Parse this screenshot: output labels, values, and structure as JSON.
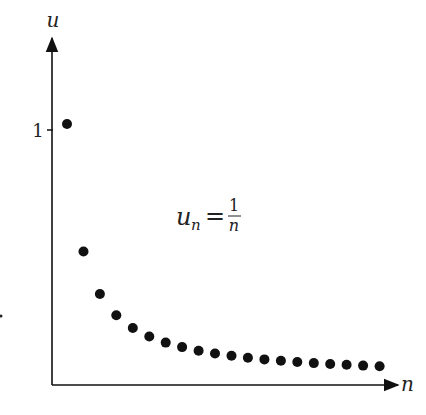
{
  "chart_data": {
    "type": "scatter",
    "title": "",
    "xlabel": "n",
    "ylabel": "u",
    "annotation": {
      "lhs": "u",
      "sub": "n",
      "eq": "=",
      "num": "1",
      "den": "n"
    },
    "y_ticks": [
      {
        "value": 1,
        "label": "1"
      }
    ],
    "x": [
      1,
      2,
      3,
      4,
      5,
      6,
      7,
      8,
      9,
      10,
      11,
      12,
      13,
      14,
      15,
      16,
      17,
      18,
      19,
      20
    ],
    "values": [
      1.0,
      0.5,
      0.3333,
      0.25,
      0.2,
      0.1667,
      0.1429,
      0.125,
      0.1111,
      0.1,
      0.0909,
      0.0833,
      0.0769,
      0.0714,
      0.0667,
      0.0625,
      0.0588,
      0.0556,
      0.0526,
      0.05
    ],
    "xlim": [
      0,
      21
    ],
    "ylim": [
      0,
      1.3
    ],
    "grid": false,
    "legend": null,
    "colors": {
      "axis": "#111111",
      "point": "#111111"
    }
  }
}
